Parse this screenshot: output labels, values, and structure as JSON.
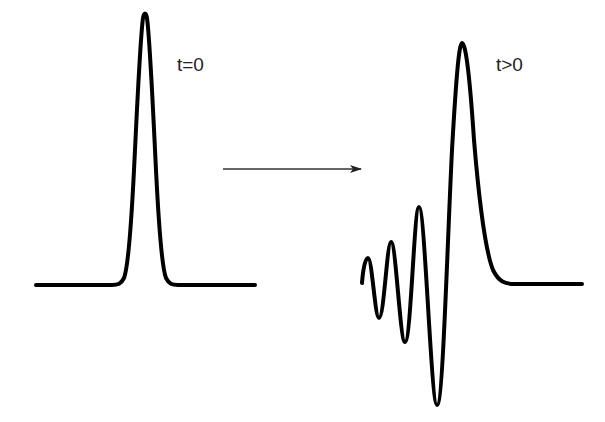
{
  "diagram": {
    "type": "wave-pulse-dispersion",
    "labels": {
      "initial": "t=0",
      "later": "t>0"
    },
    "colors": {
      "stroke": "#000000",
      "text": "#222222",
      "background": "#ffffff"
    },
    "elements": [
      {
        "id": "initial-pulse",
        "description": "Narrow symmetric Gaussian pulse at t=0"
      },
      {
        "id": "time-arrow",
        "description": "Arrow indicating time evolution (left to right)"
      },
      {
        "id": "dispersed-pulse",
        "description": "Broadened pulse with oscillating trailing wavetrain at t>0"
      }
    ]
  }
}
